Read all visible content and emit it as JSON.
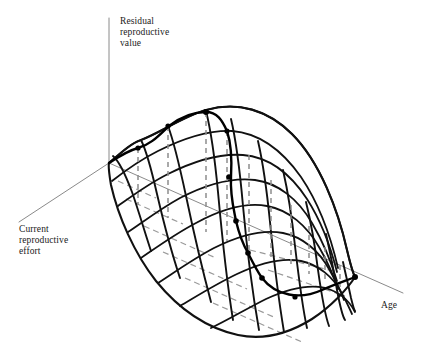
{
  "figure": {
    "title": "",
    "background": "#ffffff",
    "width": 426,
    "height": 355
  },
  "colors": {
    "axis": "#8a8a8a",
    "surface_edge": "#111111",
    "mesh": "#111111",
    "ridge": "#000000",
    "drop_line": "#8d8d8d",
    "base_dash": "#9a9a9a",
    "dot": "#000000",
    "text": "#1a1a1a"
  },
  "axes": {
    "vertical": {
      "name": "residual-reproductive-value-axis",
      "label_lines": [
        "Residual",
        "reproductive",
        "value"
      ],
      "label_text": "Residual reproductive value",
      "from": [
        109,
        18
      ],
      "to": [
        109,
        163
      ],
      "label_pos": [
        120,
        24
      ]
    },
    "depth": {
      "name": "current-reproductive-effort-axis",
      "label_lines": [
        "Current",
        "reproductive",
        "effort"
      ],
      "label_text": "Current reproductive effort",
      "from": [
        109,
        163
      ],
      "to": [
        19,
        222
      ],
      "label_pos": [
        19,
        232
      ]
    },
    "horizontal": {
      "name": "age-axis",
      "label_lines": [
        "Age"
      ],
      "label_text": "Age",
      "from": [
        109,
        163
      ],
      "to": [
        403,
        293
      ],
      "label_pos": [
        381,
        308
      ]
    }
  },
  "chart_data": {
    "type": "line",
    "subtype": "3d-surface-mesh",
    "title": "",
    "xlabel": "Age",
    "ylabel": "Current reproductive effort",
    "zlabel": "Residual reproductive value",
    "grid": false,
    "legend": null,
    "annotations": [],
    "outline": "M109,163 C124,150 132,143 141,140 C160,133 184,116 206,110 C238,101 268,110 292,134 C320,162 338,210 347,250 C352,271 354,275 355,277 C348,288 332,306 312,319 C288,334 262,340 238,335 C206,328 178,308 156,281 C134,253 118,216 111,185 C109,173 108,167 109,163 Z",
    "ridge": {
      "name": "optimal-effort-ridge",
      "path": "M109,163 C118,157 127,151 138,148 C152,144 160,134 169,126 C182,116 193,112 206,112 C217,112 222,120 227,131 C231,143 232,160 231,177 C230,196 234,210 236,221 C240,238 244,246 248,253 C253,263 257,271 262,278 C276,296 300,300 322,290 C338,283 348,280 355,277",
      "points": [
        {
          "x": 138,
          "y": 148,
          "r": 2.6
        },
        {
          "x": 168,
          "y": 126,
          "r": 2.6
        },
        {
          "x": 206,
          "y": 112,
          "r": 3.0
        },
        {
          "x": 227,
          "y": 131,
          "r": 2.6
        },
        {
          "x": 229,
          "y": 177,
          "r": 2.8
        },
        {
          "x": 236,
          "y": 221,
          "r": 2.8
        },
        {
          "x": 248,
          "y": 253,
          "r": 2.8
        },
        {
          "x": 262,
          "y": 278,
          "r": 2.8
        },
        {
          "x": 295,
          "y": 297,
          "r": 2.6
        },
        {
          "x": 355,
          "y": 277,
          "r": 3.0
        }
      ],
      "drop_lines": [
        {
          "x": 138,
          "y1": 148,
          "y2": 205
        },
        {
          "x": 168,
          "y1": 126,
          "y2": 218
        },
        {
          "x": 206,
          "y1": 112,
          "y2": 232
        },
        {
          "x": 227,
          "y1": 131,
          "y2": 241
        },
        {
          "x": 249,
          "y1": 155,
          "y2": 250
        },
        {
          "x": 271,
          "y1": 180,
          "y2": 259
        },
        {
          "x": 291,
          "y1": 205,
          "y2": 267
        },
        {
          "x": 309,
          "y1": 226,
          "y2": 274
        },
        {
          "x": 325,
          "y1": 247,
          "y2": 281
        },
        {
          "x": 340,
          "y1": 265,
          "y2": 287
        }
      ]
    },
    "mesh_age_curves": [
      {
        "name": "age-curve-1",
        "path": "M113,156 C120,162 126,176 132,192 C139,212 145,233 151,251"
      },
      {
        "name": "age-curve-2",
        "path": "M141,140 C147,152 152,172 157,194 C164,224 172,254 180,278"
      },
      {
        "name": "age-curve-3",
        "path": "M168,126 C174,142 180,168 186,196 C194,234 203,272 211,302"
      },
      {
        "name": "age-curve-4",
        "path": "M206,111 C211,131 215,160 218,192 C222,236 227,283 233,320"
      },
      {
        "name": "age-curve-5",
        "path": "M231,119 C236,140 240,172 243,206 C247,250 253,296 259,330"
      },
      {
        "name": "age-curve-6",
        "path": "M258,141 C263,163 267,192 270,222 C274,262 279,302 284,332"
      },
      {
        "name": "age-curve-7",
        "path": "M283,170 C288,192 292,218 295,246 C299,280 303,310 307,328"
      },
      {
        "name": "age-curve-8",
        "path": "M306,202 C311,222 315,246 318,270 C322,298 326,318 329,326"
      },
      {
        "name": "age-curve-9",
        "path": "M326,234 C330,252 334,272 337,290 C340,306 343,317 345,320"
      },
      {
        "name": "age-curve-10",
        "path": "M343,262 C346,276 349,288 351,298 C353,306 354,310 355,311"
      }
    ],
    "mesh_effort_curves": [
      {
        "name": "effort-curve-1",
        "path": "M109,163 C124,150 132,143 141,140 C160,133 184,116 206,110 C238,101 268,110 292,134 C320,162 338,210 347,250 C352,271 354,275 355,277"
      },
      {
        "name": "effort-curve-2",
        "path": "M112,181 C126,170 140,160 158,151 C182,139 208,130 232,131 C258,133 282,150 301,177 C320,205 332,242 338,268"
      },
      {
        "name": "effort-curve-3",
        "path": "M118,206 C132,196 148,184 168,174 C192,162 218,153 243,155 C268,157 290,173 307,199 C323,224 332,252 337,272"
      },
      {
        "name": "effort-curve-4",
        "path": "M128,232 C143,222 160,209 180,198 C205,185 231,177 255,180 C278,183 298,199 312,223 C325,245 333,268 337,281"
      },
      {
        "name": "effort-curve-5",
        "path": "M141,258 C157,247 175,234 196,223 C220,210 245,202 267,206 C289,210 307,226 319,247 C329,264 335,280 338,289"
      },
      {
        "name": "effort-curve-6",
        "path": "M158,283 C175,272 193,259 214,248 C238,236 262,229 283,233 C303,237 319,251 329,269 C337,283 342,294 344,300"
      },
      {
        "name": "effort-curve-7",
        "path": "M180,306 C197,296 216,284 237,274 C260,263 282,257 301,261 C319,265 333,277 341,292 C347,302 350,310 352,314"
      },
      {
        "name": "effort-curve-8",
        "path": "M211,328 C228,320 246,309 266,299 C288,289 308,284 325,288 C340,292 350,302 355,312"
      }
    ],
    "base_plane_dashes": [
      {
        "name": "base-dash-1",
        "from": [
          126,
          199
        ],
        "to": [
          183,
          224
        ]
      },
      {
        "name": "base-dash-2",
        "from": [
          144,
          226
        ],
        "to": [
          216,
          258
        ]
      },
      {
        "name": "base-dash-3",
        "from": [
          163,
          252
        ],
        "to": [
          247,
          289
        ]
      },
      {
        "name": "base-dash-4",
        "from": [
          185,
          278
        ],
        "to": [
          276,
          318
        ]
      },
      {
        "name": "base-dash-5",
        "from": [
          213,
          303
        ],
        "to": [
          302,
          342
        ]
      },
      {
        "name": "base-dash-6",
        "from": [
          118,
          181
        ],
        "to": [
          156,
          198
        ]
      },
      {
        "name": "base-dash-7",
        "from": [
          250,
          250
        ],
        "to": [
          337,
          272
        ]
      },
      {
        "name": "base-dash-8",
        "from": [
          268,
          270
        ],
        "to": [
          345,
          296
        ]
      }
    ]
  }
}
